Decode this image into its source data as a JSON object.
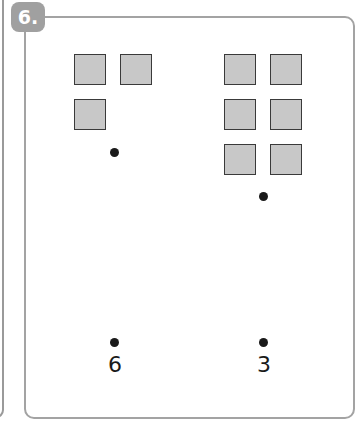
{
  "exercise": {
    "badge": "6.",
    "columns": [
      {
        "id": "left",
        "squares": 3,
        "label": "6"
      },
      {
        "id": "right",
        "squares": 6,
        "label": "3"
      }
    ]
  },
  "colors": {
    "square_fill": "#c8c8c8",
    "border": "#a3a3a3",
    "badge": "#a0a0a0"
  }
}
